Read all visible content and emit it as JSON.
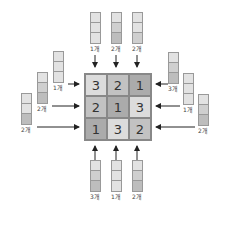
{
  "grid": {
    "rows": [
      [
        {
          "value": "3",
          "shade": "c3"
        },
        {
          "value": "2",
          "shade": "c2"
        },
        {
          "value": "1",
          "shade": "c1"
        }
      ],
      [
        {
          "value": "2",
          "shade": "c2"
        },
        {
          "value": "1",
          "shade": "c1"
        },
        {
          "value": "3",
          "shade": "c3"
        }
      ],
      [
        {
          "value": "1",
          "shade": "c1"
        },
        {
          "value": "3",
          "shade": "c3"
        },
        {
          "value": "2",
          "shade": "c2"
        }
      ]
    ]
  },
  "clues": {
    "top": [
      "1개",
      "2개",
      "2개"
    ],
    "bottom": [
      "3개",
      "1개",
      "2개"
    ],
    "left": [
      "1개",
      "2개",
      "2개"
    ],
    "right": [
      "3개",
      "1개",
      "2개"
    ]
  },
  "colors": {
    "light": "#dcdcdc",
    "medium": "#c2c2c2",
    "dark": "#ababab"
  }
}
